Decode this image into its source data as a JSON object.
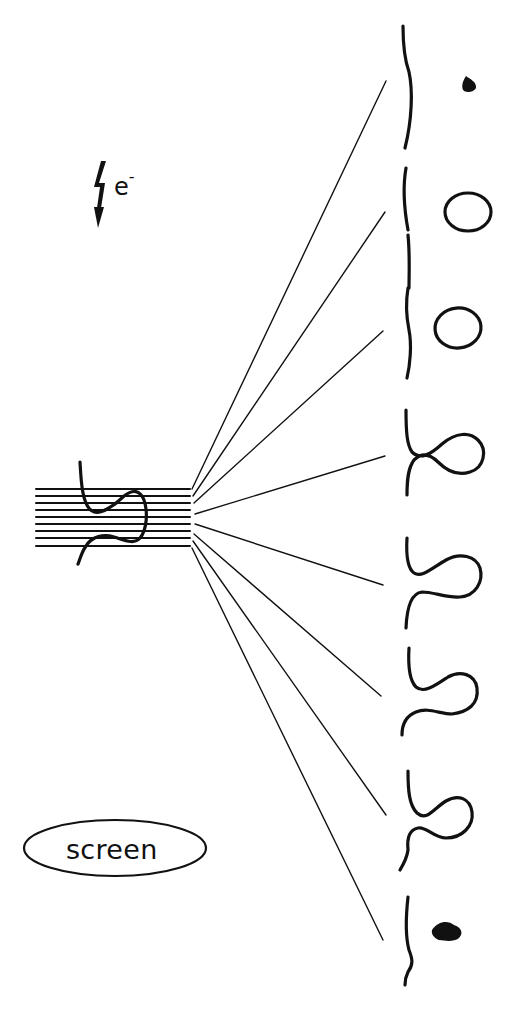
{
  "labels": {
    "electron_base": "e",
    "electron_charge": "-",
    "screen": "screen"
  },
  "icons": {
    "electron_beam": "lightning-bolt-arrow-icon"
  },
  "diagram": {
    "source_beam_lines": 9,
    "fan_rays": 8,
    "projections": [
      "dot",
      "ellipse",
      "ellipse",
      "loop-crossing",
      "s-curve",
      "s-curve",
      "loop-curve",
      "dot"
    ]
  }
}
